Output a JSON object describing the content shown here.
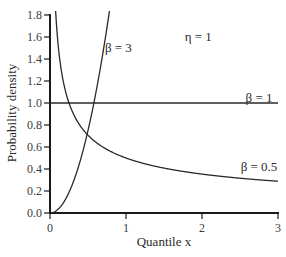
{
  "chart_data": {
    "type": "line",
    "title": "",
    "xlabel": "Quantile x",
    "ylabel": "Probability density",
    "xlim": [
      0,
      3
    ],
    "ylim": [
      0,
      1.8
    ],
    "x_ticks": [
      0,
      1,
      2,
      3
    ],
    "x_tick_labels": [
      "0",
      "1",
      "2",
      "3"
    ],
    "y_ticks": [
      0.0,
      0.2,
      0.4,
      0.6,
      0.8,
      1.0,
      1.2,
      1.4,
      1.6,
      1.8
    ],
    "y_tick_labels": [
      "0.0",
      "0.2",
      "0.4",
      "0.6",
      "0.8",
      "1.0",
      "1.2",
      "1.4",
      "1.6",
      "1.8"
    ],
    "grid": false,
    "legend": "none (inline labels)",
    "annotations": [
      {
        "text": "η = 1",
        "x": 1.95,
        "y": 1.6
      },
      {
        "text": "β = 3",
        "x": 0.9,
        "y": 1.5
      },
      {
        "text": "β = 1",
        "x": 2.75,
        "y": 1.05
      },
      {
        "text": "β = 0.5",
        "x": 2.75,
        "y": 0.42
      }
    ],
    "series": [
      {
        "name": "β = 0.5",
        "beta": 0.5,
        "formula": "beta * x^(beta-1)",
        "x": [
          0.08,
          0.1,
          0.2,
          0.3,
          0.5,
          0.75,
          1.0,
          1.5,
          2.0,
          2.5,
          3.0
        ],
        "values": [
          1.77,
          1.58,
          1.12,
          0.91,
          0.71,
          0.58,
          0.5,
          0.41,
          0.35,
          0.32,
          0.29
        ]
      },
      {
        "name": "β = 1",
        "beta": 1,
        "formula": "beta * x^(beta-1)",
        "x": [
          0,
          1,
          2,
          3
        ],
        "values": [
          1.0,
          1.0,
          1.0,
          1.0
        ]
      },
      {
        "name": "β = 3",
        "beta": 3,
        "formula": "beta * x^(beta-1)",
        "x": [
          0,
          0.1,
          0.2,
          0.3,
          0.4,
          0.5,
          0.577,
          0.6,
          0.7,
          0.775
        ],
        "values": [
          0,
          0.03,
          0.12,
          0.27,
          0.48,
          0.75,
          1.0,
          1.08,
          1.47,
          1.8
        ]
      }
    ]
  },
  "colors": {
    "axis": "#1a1a1a",
    "line": "#2a2a2a",
    "text": "#2a2a2a"
  }
}
